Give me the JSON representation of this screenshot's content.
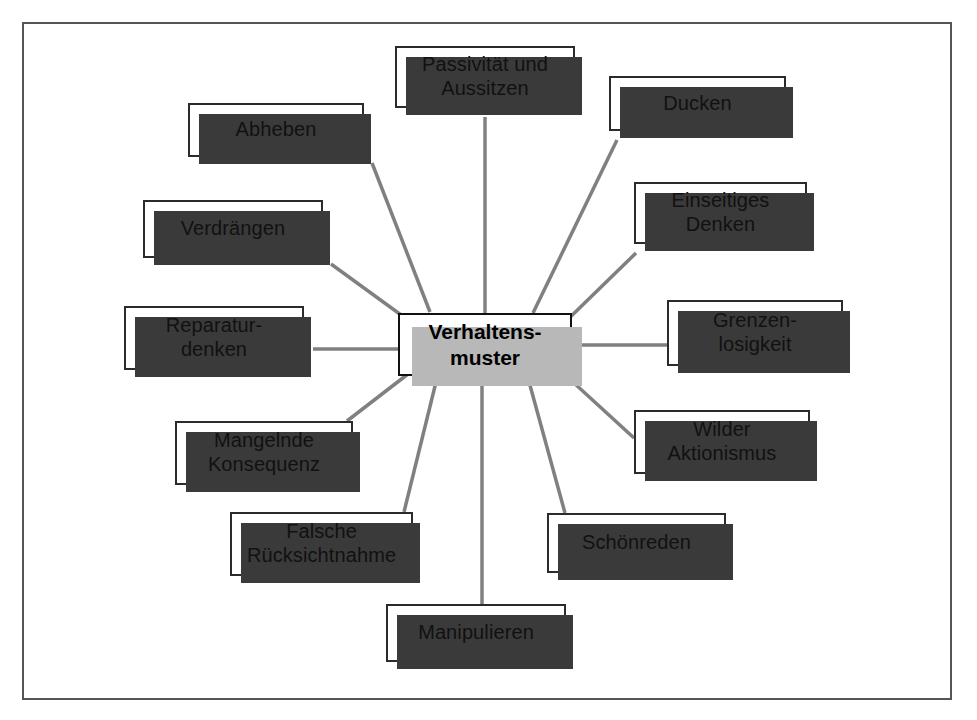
{
  "diagram": {
    "type": "mind-map",
    "frame_border_color": "#555555",
    "node_border_color": "#2b2b2b",
    "node_shadow_color": "#3a3a3a",
    "center_shadow_color": "#b8b8b8",
    "edge_color": "#808080",
    "background_color": "#ffffff",
    "center": {
      "label": "Verhaltens-\nmuster",
      "x": 398,
      "y": 313,
      "w": 174,
      "h": 63
    },
    "nodes": [
      {
        "label": "Passivität und\nAussitzen",
        "x": 395,
        "y": 46,
        "w": 180,
        "h": 62,
        "anchor": "bottom"
      },
      {
        "label": "Ducken",
        "x": 609,
        "y": 76,
        "w": 177,
        "h": 55,
        "anchor": "bottom-left"
      },
      {
        "label": "Einseitiges\nDenken",
        "x": 634,
        "y": 182,
        "w": 173,
        "h": 62,
        "anchor": "bottom-left"
      },
      {
        "label": "Grenzen-\nlosigkeit",
        "x": 667,
        "y": 300,
        "w": 176,
        "h": 66,
        "anchor": "left"
      },
      {
        "label": "Wilder\nAktionismus",
        "x": 634,
        "y": 410,
        "w": 176,
        "h": 64,
        "anchor": "left"
      },
      {
        "label": "Schönreden",
        "x": 547,
        "y": 513,
        "w": 179,
        "h": 60,
        "anchor": "top-left"
      },
      {
        "label": "Manipulieren",
        "x": 386,
        "y": 604,
        "w": 180,
        "h": 58,
        "anchor": "top"
      },
      {
        "label": "Falsche\nRücksichtnahme",
        "x": 230,
        "y": 512,
        "w": 183,
        "h": 64,
        "anchor": "top-right"
      },
      {
        "label": "Mangelnde\nKonsequenz",
        "x": 175,
        "y": 421,
        "w": 178,
        "h": 64,
        "anchor": "top-right"
      },
      {
        "label": "Reparatur-\ndenken",
        "x": 124,
        "y": 306,
        "w": 180,
        "h": 64,
        "anchor": "right"
      },
      {
        "label": "Verdrängen",
        "x": 143,
        "y": 200,
        "w": 180,
        "h": 58,
        "anchor": "bottom-right"
      },
      {
        "label": "Abheben",
        "x": 188,
        "y": 103,
        "w": 176,
        "h": 54,
        "anchor": "bottom-right"
      }
    ],
    "edges": [
      {
        "from": "center",
        "to": "Passivität und Aussitzen",
        "x1": 485,
        "y1": 313,
        "x2": 485,
        "y2": 117
      },
      {
        "from": "center",
        "to": "Ducken",
        "x1": 533,
        "y1": 313,
        "x2": 617,
        "y2": 140
      },
      {
        "from": "center",
        "to": "Einseitiges Denken",
        "x1": 560,
        "y1": 327,
        "x2": 636,
        "y2": 253
      },
      {
        "from": "center",
        "to": "Grenzenlosigkeit",
        "x1": 580,
        "y1": 345,
        "x2": 667,
        "y2": 345
      },
      {
        "from": "center",
        "to": "Wilder Aktionismus",
        "x1": 562,
        "y1": 372,
        "x2": 634,
        "y2": 438
      },
      {
        "from": "center",
        "to": "Schönreden",
        "x1": 528,
        "y1": 378,
        "x2": 565,
        "y2": 513
      },
      {
        "from": "center",
        "to": "Manipulieren",
        "x1": 482,
        "y1": 378,
        "x2": 482,
        "y2": 604
      },
      {
        "from": "center",
        "to": "Falsche Rücksichtnahme",
        "x1": 437,
        "y1": 378,
        "x2": 404,
        "y2": 512
      },
      {
        "from": "center",
        "to": "Mangelnde Konsequenz",
        "x1": 408,
        "y1": 374,
        "x2": 347,
        "y2": 421
      },
      {
        "from": "center",
        "to": "Reparaturdenken",
        "x1": 398,
        "y1": 349,
        "x2": 313,
        "y2": 349
      },
      {
        "from": "center",
        "to": "Verdrängen",
        "x1": 408,
        "y1": 320,
        "x2": 331,
        "y2": 264
      },
      {
        "from": "center",
        "to": "Abheben",
        "x1": 430,
        "y1": 312,
        "x2": 372,
        "y2": 163
      }
    ]
  }
}
